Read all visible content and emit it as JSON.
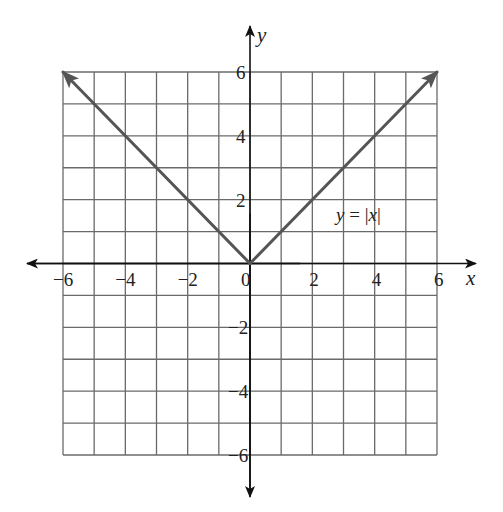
{
  "chart_data": {
    "type": "line",
    "title": "",
    "xlabel": "x",
    "ylabel": "y",
    "xlim": [
      -6,
      6
    ],
    "ylim": [
      -6,
      6
    ],
    "grid": true,
    "grid_step": 1,
    "x_ticks": [
      -6,
      -4,
      -2,
      0,
      2,
      4,
      6
    ],
    "y_ticks": [
      -6,
      -4,
      -2,
      2,
      4,
      6
    ],
    "x_tick_labels": [
      "−6",
      "−4",
      "−2",
      "0",
      "2",
      "4",
      "6"
    ],
    "y_tick_labels": [
      "−6",
      "−4",
      "−2",
      "2",
      "4",
      "6"
    ],
    "series": [
      {
        "name": "y = |x|",
        "x": [
          -6,
          0,
          6
        ],
        "y": [
          6,
          0,
          6
        ],
        "arrows_at_ends": true
      }
    ],
    "annotations": [
      {
        "text": "y = |x|",
        "x": 3,
        "y": 1.5
      }
    ]
  },
  "labels": {
    "x_axis": "x",
    "y_axis": "y",
    "fn_y": "y",
    "fn_eq": " = ",
    "fn_bar_open": "|",
    "fn_x": "x",
    "fn_bar_close": "|"
  },
  "colors": {
    "grid": "#6a6a6a",
    "axes": "#111111",
    "function": "#555555"
  }
}
